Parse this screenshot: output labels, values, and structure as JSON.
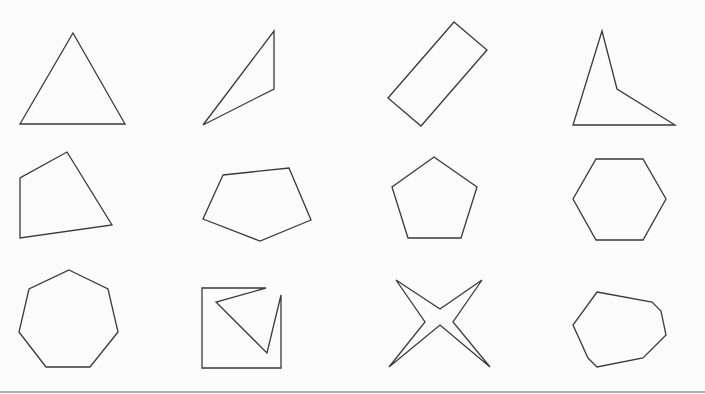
{
  "figure": {
    "stroke_color": "#3a3a3a",
    "background": "#fbfbfb",
    "shapes": [
      {
        "name": "equilateral-triangle",
        "points": "73,33 125,124 20,124"
      },
      {
        "name": "obtuse-triangle",
        "points": "274,31 274,89 203,125"
      },
      {
        "name": "rotated-rectangle",
        "points": "454,22 487,50 421,126 388,98"
      },
      {
        "name": "concave-quadrilateral",
        "points": "602,31 617,89 675,125 573,125"
      },
      {
        "name": "irregular-quadrilateral",
        "points": "67,152 112,225 20,238 20,178"
      },
      {
        "name": "irregular-pentagon",
        "points": "223,175 289,168 311,220 260,241 203,219"
      },
      {
        "name": "regular-pentagon",
        "points": "434,157 477,187 461,238 408,238 392,187"
      },
      {
        "name": "regular-hexagon",
        "points": "596,159 643,159 666,199 643,240 596,240 573,199"
      },
      {
        "name": "regular-heptagon",
        "points": "69,270 108,289 118,332 90,367 46,367 19,332 29,289"
      },
      {
        "name": "concave-heptagon",
        "points": "266,288 216,302 267,353 281,295 281,368 202,368 202,288"
      },
      {
        "name": "four-point-star",
        "points": "396,280 440,309 482,280 453,322 490,367 440,325 389,367 425,322"
      },
      {
        "name": "irregular-octagon",
        "points": "597,292 652,302 661,311 666,335 643,358 597,367 588,358 573,325"
      }
    ]
  }
}
